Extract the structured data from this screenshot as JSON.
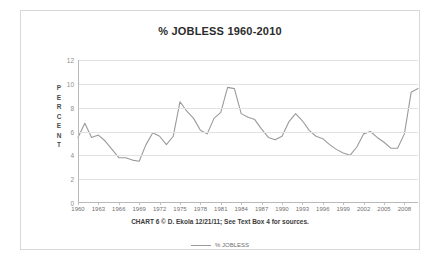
{
  "chart_data": {
    "type": "line",
    "title": "% JOBLESS 1960-2010",
    "caption": "CHART 6 © D. Ekola 12/21/11; See Text Box 4 for sources.",
    "xlabel": "",
    "ylabel": "PERCENT",
    "ylim": [
      0,
      12
    ],
    "xlim": [
      1960,
      2010
    ],
    "grid": true,
    "legend_position": "bottom",
    "line_color": "#9a9a9a",
    "ytick_labels": [
      "0",
      "2",
      "4",
      "6",
      "8",
      "10",
      "12"
    ],
    "yticks": [
      0,
      2,
      4,
      6,
      8,
      10,
      12
    ],
    "xtick_labels": [
      "1960",
      "1963",
      "1966",
      "1969",
      "1972",
      "1975",
      "1978",
      "1981",
      "1984",
      "1987",
      "1990",
      "1993",
      "1996",
      "1999",
      "2002",
      "2005",
      "2008"
    ],
    "xticks": [
      1960,
      1963,
      1966,
      1969,
      1972,
      1975,
      1978,
      1981,
      1984,
      1987,
      1990,
      1993,
      1996,
      1999,
      2002,
      2005,
      2008
    ],
    "series": [
      {
        "name": "% JOBLESS",
        "x": [
          1960,
          1961,
          1962,
          1963,
          1964,
          1965,
          1966,
          1967,
          1968,
          1969,
          1970,
          1971,
          1972,
          1973,
          1974,
          1975,
          1976,
          1977,
          1978,
          1979,
          1980,
          1981,
          1982,
          1983,
          1984,
          1985,
          1986,
          1987,
          1988,
          1989,
          1990,
          1991,
          1992,
          1993,
          1994,
          1995,
          1996,
          1997,
          1998,
          1999,
          2000,
          2001,
          2002,
          2003,
          2004,
          2005,
          2006,
          2007,
          2008,
          2009,
          2010
        ],
        "values": [
          5.5,
          6.7,
          5.5,
          5.7,
          5.2,
          4.5,
          3.8,
          3.8,
          3.6,
          3.5,
          4.9,
          5.9,
          5.6,
          4.9,
          5.6,
          8.5,
          7.7,
          7.1,
          6.1,
          5.8,
          7.1,
          7.6,
          9.7,
          9.6,
          7.5,
          7.2,
          7.0,
          6.2,
          5.5,
          5.3,
          5.6,
          6.8,
          7.5,
          6.9,
          6.1,
          5.6,
          5.4,
          4.9,
          4.5,
          4.2,
          4.0,
          4.7,
          5.8,
          6.0,
          5.5,
          5.1,
          4.6,
          4.6,
          5.8,
          9.3,
          9.6
        ]
      }
    ]
  },
  "legend": {
    "entries": [
      {
        "label": "% JOBLESS",
        "marker": "line-swatch"
      }
    ]
  }
}
